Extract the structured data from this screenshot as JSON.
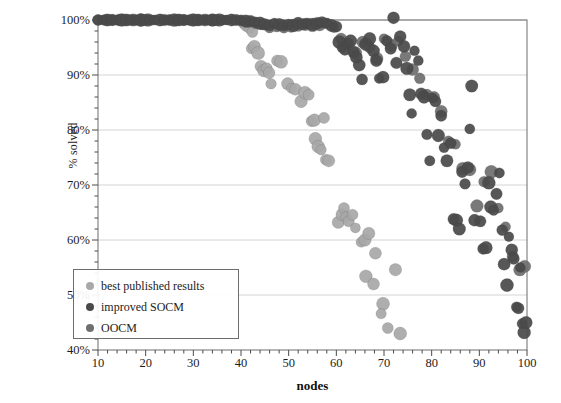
{
  "chart_data": {
    "type": "scatter",
    "title": "",
    "xlabel": "nodes",
    "ylabel": "% solved",
    "xlim": [
      10,
      100
    ],
    "ylim": [
      40,
      100
    ],
    "xticks": [
      10,
      20,
      30,
      40,
      50,
      60,
      70,
      80,
      90,
      100
    ],
    "yticks": [
      40,
      50,
      60,
      70,
      80,
      90,
      100
    ],
    "ytick_labels": [
      "40%",
      "50%",
      "60%",
      "70%",
      "80%",
      "90%",
      "100%"
    ],
    "xtick_labels": [
      "10",
      "20",
      "30",
      "40",
      "50",
      "60",
      "70",
      "80",
      "90",
      "100"
    ],
    "grid": "horizontal",
    "legend_position": "lower-left",
    "minor_ticks_x": true,
    "minor_ticks_y": true,
    "series": [
      {
        "name": "best published results",
        "color": "#a8a8a8",
        "marker": "circle",
        "points": [
          [
            40.6,
            99.4
          ],
          [
            41.2,
            99.0
          ],
          [
            41.8,
            98.4
          ],
          [
            42.4,
            97.8
          ],
          [
            42.2,
            94.8
          ],
          [
            42.8,
            95.2
          ],
          [
            43.6,
            94.0
          ],
          [
            44.2,
            91.6
          ],
          [
            44.8,
            90.8
          ],
          [
            45.4,
            91.2
          ],
          [
            45.9,
            90.4
          ],
          [
            46.3,
            88.4
          ],
          [
            47.6,
            92.6
          ],
          [
            48.4,
            92.4
          ],
          [
            49.8,
            88.4
          ],
          [
            50.6,
            87.6
          ],
          [
            51.4,
            87.4
          ],
          [
            52.6,
            85.2
          ],
          [
            53.4,
            86.8
          ],
          [
            54.2,
            86.4
          ],
          [
            54.8,
            81.6
          ],
          [
            55.4,
            81.8
          ],
          [
            57.4,
            82.2
          ],
          [
            55.6,
            78.4
          ],
          [
            56.2,
            77.0
          ],
          [
            56.8,
            76.4
          ],
          [
            57.8,
            74.6
          ],
          [
            58.4,
            74.4
          ],
          [
            60.4,
            63.2
          ],
          [
            61.2,
            64.6
          ],
          [
            61.6,
            65.8
          ],
          [
            62.0,
            64.2
          ],
          [
            62.6,
            63.4
          ],
          [
            63.4,
            64.6
          ],
          [
            64.0,
            62.2
          ],
          [
            65.2,
            59.6
          ],
          [
            66.0,
            60.0
          ],
          [
            66.8,
            61.2
          ],
          [
            68.2,
            57.6
          ],
          [
            66.2,
            53.4
          ],
          [
            67.8,
            52.0
          ],
          [
            72.4,
            54.6
          ],
          [
            69.8,
            48.4
          ],
          [
            69.4,
            46.6
          ],
          [
            70.8,
            44.0
          ],
          [
            73.4,
            43.0
          ]
        ]
      },
      {
        "name": "improved SOCM",
        "color": "#4a4a4a",
        "marker": "circle",
        "points": [
          [
            10,
            100
          ],
          [
            11,
            100
          ],
          [
            12,
            100
          ],
          [
            13,
            100
          ],
          [
            14,
            100
          ],
          [
            15,
            100
          ],
          [
            16,
            100
          ],
          [
            17,
            100
          ],
          [
            18,
            100
          ],
          [
            19,
            100
          ],
          [
            20,
            100
          ],
          [
            21,
            100
          ],
          [
            22,
            100
          ],
          [
            23,
            100
          ],
          [
            24,
            100
          ],
          [
            25,
            100
          ],
          [
            26,
            100
          ],
          [
            27,
            100
          ],
          [
            28,
            100
          ],
          [
            29,
            100
          ],
          [
            30,
            100
          ],
          [
            31,
            100
          ],
          [
            32,
            100
          ],
          [
            33,
            100
          ],
          [
            34,
            100
          ],
          [
            35,
            100
          ],
          [
            36,
            100
          ],
          [
            37,
            100
          ],
          [
            38,
            100
          ],
          [
            39,
            100
          ],
          [
            40,
            100
          ],
          [
            41,
            99.8
          ],
          [
            42,
            99.8
          ],
          [
            43,
            99.6
          ],
          [
            44,
            99.4
          ],
          [
            45,
            99.2
          ],
          [
            46,
            99.0
          ],
          [
            47,
            99.4
          ],
          [
            48,
            99.2
          ],
          [
            49,
            99.0
          ],
          [
            50,
            99.2
          ],
          [
            51,
            99.0
          ],
          [
            52,
            99.4
          ],
          [
            53,
            99.2
          ],
          [
            54,
            99.4
          ],
          [
            55,
            99.2
          ],
          [
            56,
            99.4
          ],
          [
            57,
            99.6
          ],
          [
            58,
            99.4
          ],
          [
            59,
            99.0
          ],
          [
            60,
            98.8
          ],
          [
            60.6,
            96.0
          ],
          [
            61.2,
            95.0
          ],
          [
            61.8,
            94.6
          ],
          [
            62.4,
            95.6
          ],
          [
            63.0,
            96.2
          ],
          [
            63.6,
            94.2
          ],
          [
            64.2,
            93.2
          ],
          [
            64.8,
            91.8
          ],
          [
            65.4,
            89.2
          ],
          [
            66.2,
            95.6
          ],
          [
            67.0,
            96.6
          ],
          [
            67.8,
            94.4
          ],
          [
            68.4,
            92.6
          ],
          [
            69.0,
            89.4
          ],
          [
            69.8,
            89.6
          ],
          [
            70.6,
            96.2
          ],
          [
            71.4,
            94.8
          ],
          [
            72.0,
            100.4
          ],
          [
            72.6,
            92.2
          ],
          [
            73.4,
            97.0
          ],
          [
            74.2,
            95.2
          ],
          [
            74.8,
            91.2
          ],
          [
            75.4,
            86.4
          ],
          [
            75.8,
            83.0
          ],
          [
            76.4,
            94.4
          ],
          [
            77.2,
            92.6
          ],
          [
            77.8,
            86.6
          ],
          [
            78.4,
            86.0
          ],
          [
            79.0,
            79.2
          ],
          [
            79.6,
            74.4
          ],
          [
            80.2,
            85.8
          ],
          [
            80.8,
            85.2
          ],
          [
            81.4,
            79.0
          ],
          [
            82.0,
            82.6
          ],
          [
            82.6,
            76.8
          ],
          [
            83.2,
            74.4
          ],
          [
            84.0,
            77.6
          ],
          [
            84.6,
            63.8
          ],
          [
            85.2,
            63.6
          ],
          [
            85.8,
            62.0
          ],
          [
            86.4,
            72.4
          ],
          [
            87.0,
            70.2
          ],
          [
            87.6,
            73.2
          ],
          [
            88.0,
            80.2
          ],
          [
            88.4,
            88.0
          ],
          [
            89.0,
            63.6
          ],
          [
            90.2,
            63.4
          ],
          [
            90.8,
            58.4
          ],
          [
            91.4,
            58.6
          ],
          [
            92.0,
            70.4
          ],
          [
            92.4,
            66.0
          ],
          [
            93.0,
            65.4
          ],
          [
            93.6,
            68.4
          ],
          [
            94.2,
            72.2
          ],
          [
            94.8,
            61.8
          ],
          [
            95.2,
            55.6
          ],
          [
            95.8,
            51.8
          ],
          [
            96.2,
            60.6
          ],
          [
            96.8,
            58.2
          ],
          [
            97.2,
            56.6
          ],
          [
            97.8,
            47.8
          ],
          [
            98.2,
            47.6
          ],
          [
            98.6,
            55.0
          ],
          [
            99.0,
            44.8
          ],
          [
            99.4,
            43.2
          ],
          [
            99.8,
            45.0
          ]
        ]
      },
      {
        "name": "OOCM",
        "color": "#6f6f6f",
        "marker": "circle",
        "points": [
          [
            10,
            100
          ],
          [
            11.5,
            100
          ],
          [
            13,
            100
          ],
          [
            14.5,
            100
          ],
          [
            16,
            100
          ],
          [
            17.5,
            100
          ],
          [
            19,
            100
          ],
          [
            20.5,
            100
          ],
          [
            22,
            100
          ],
          [
            23.5,
            100
          ],
          [
            25,
            100
          ],
          [
            26.5,
            100
          ],
          [
            28,
            100
          ],
          [
            29.5,
            100
          ],
          [
            31,
            100
          ],
          [
            32.5,
            100
          ],
          [
            34,
            100
          ],
          [
            35.5,
            100
          ],
          [
            37,
            100
          ],
          [
            38.5,
            100
          ],
          [
            40,
            99.8
          ],
          [
            41.5,
            99.6
          ],
          [
            43,
            99.4
          ],
          [
            44.5,
            99.2
          ],
          [
            46,
            98.6
          ],
          [
            47.5,
            98.8
          ],
          [
            49,
            98.6
          ],
          [
            50.5,
            98.8
          ],
          [
            52,
            99.0
          ],
          [
            53.5,
            99.2
          ],
          [
            55,
            99.0
          ],
          [
            56.5,
            99.2
          ],
          [
            58,
            99.4
          ],
          [
            59.5,
            98.6
          ],
          [
            61,
            96.6
          ],
          [
            62.5,
            95.8
          ],
          [
            64,
            94.0
          ],
          [
            65.5,
            96.0
          ],
          [
            67,
            95.0
          ],
          [
            68.5,
            93.0
          ],
          [
            70,
            96.6
          ],
          [
            71.5,
            95.4
          ],
          [
            73,
            96.2
          ],
          [
            74.5,
            93.4
          ],
          [
            76,
            91.0
          ],
          [
            77.5,
            89.4
          ],
          [
            79,
            86.4
          ],
          [
            80.5,
            86.0
          ],
          [
            82,
            83.4
          ],
          [
            83.5,
            78.0
          ],
          [
            85,
            77.4
          ],
          [
            86.5,
            73.0
          ],
          [
            88,
            72.8
          ],
          [
            89.5,
            66.2
          ],
          [
            91,
            70.6
          ],
          [
            92.5,
            72.4
          ],
          [
            94,
            65.8
          ],
          [
            95.5,
            62.4
          ],
          [
            97,
            57.0
          ],
          [
            98.5,
            54.6
          ],
          [
            99.5,
            55.2
          ]
        ]
      }
    ]
  },
  "axes": {
    "y_title": "% solved",
    "x_title": "nodes"
  },
  "legend": {
    "items": [
      {
        "label": "best published results",
        "color": "#a8a8a8"
      },
      {
        "label": "improved SOCM",
        "color": "#4a4a4a"
      },
      {
        "label": "OOCM",
        "color": "#6f6f6f"
      }
    ]
  }
}
